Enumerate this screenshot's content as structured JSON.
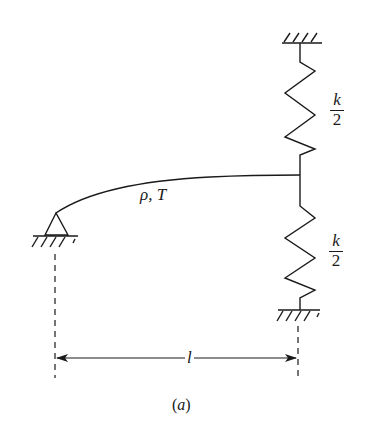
{
  "figure": {
    "caption_open": "(",
    "caption_letter": "a",
    "caption_close": ")",
    "string_label": "ρ, T",
    "length_label": "l",
    "upper_spring": {
      "numerator": "k",
      "denominator": "2"
    },
    "lower_spring": {
      "numerator": "k",
      "denominator": "2"
    },
    "colors": {
      "line": "#1a1a1a",
      "background": "#ffffff"
    }
  }
}
